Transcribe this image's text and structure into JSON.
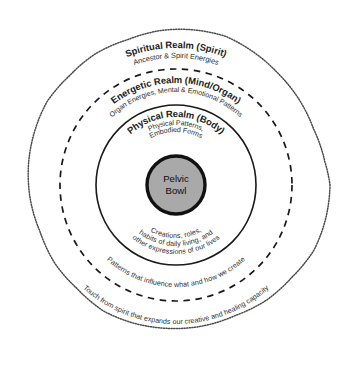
{
  "diagram": {
    "core": {
      "label_line1": "Pelvic",
      "label_line2": "Bowl",
      "fill_color": "#a9a9a9",
      "stroke_color": "#111111"
    },
    "rings": [
      {
        "id": "physical",
        "heading": "Physical Realm (Body)",
        "sub_line1": "Physical Patterns,",
        "sub_line2": "Embodied Forms",
        "border_style": "solid",
        "radius": 80,
        "lower_lines": [
          "Creations, roles,",
          "habits of daily living, and",
          "other expressions of our lives"
        ]
      },
      {
        "id": "energetic",
        "heading": "Energetic Realm (Mind/Organ)",
        "sub_line1": "Organ Energies, Mental & Emotional Patterns",
        "sub_line2": "",
        "border_style": "dashed",
        "radius": 116,
        "lower_lines": [
          "Patterns that influence what and how we create"
        ]
      },
      {
        "id": "spiritual",
        "heading": "Spiritual Realm (Spirit)",
        "sub_line1": "Ancestor & Spirit Energies",
        "sub_line2": "",
        "border_style": "wavy-dotted",
        "radius": 154,
        "lower_lines": [
          "Touch from spirit that expands our creative and healing capacity"
        ]
      }
    ]
  }
}
